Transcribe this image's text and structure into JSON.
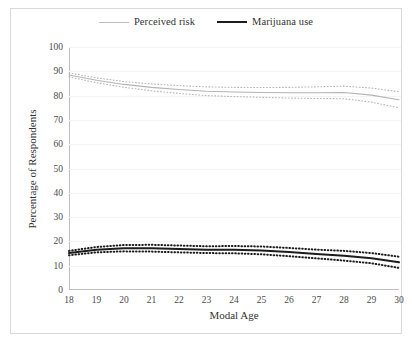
{
  "legend": {
    "items": [
      {
        "label": "Perceived risk",
        "color": "#bcbcbc",
        "style": "thin"
      },
      {
        "label": "Marijuana use",
        "color": "#1c1c1c",
        "style": "thick"
      }
    ]
  },
  "axes": {
    "xlabel": "Modal Age",
    "ylabel": "Percentage of Respondents",
    "yticks": [
      "100",
      "90",
      "80",
      "70",
      "60",
      "50",
      "40",
      "30",
      "20",
      "10",
      "0"
    ],
    "xticks": [
      "18",
      "19",
      "20",
      "21",
      "22",
      "23",
      "24",
      "25",
      "26",
      "27",
      "28",
      "29",
      "30"
    ]
  },
  "chart_data": {
    "type": "line",
    "title": "",
    "xlabel": "Modal Age",
    "ylabel": "Percentage of Respondents",
    "xlim": [
      18,
      30
    ],
    "ylim": [
      0,
      100
    ],
    "ytick_step": 10,
    "grid": false,
    "legend_position": "top-center",
    "x": [
      18,
      19,
      20,
      21,
      22,
      23,
      24,
      25,
      26,
      27,
      28,
      29,
      30
    ],
    "series": [
      {
        "name": "Perceived risk",
        "color": "#b4b4b4",
        "line": "solid",
        "values": [
          88.5,
          86.3,
          84.6,
          83.4,
          82.5,
          81.8,
          81.5,
          81.3,
          81.2,
          81.2,
          81.3,
          80.2,
          78.3
        ],
        "ci_upper": [
          89.3,
          87.3,
          85.8,
          84.8,
          84.1,
          83.6,
          83.4,
          83.3,
          83.4,
          83.6,
          83.9,
          83.1,
          81.6
        ],
        "ci_lower": [
          87.7,
          85.3,
          83.4,
          82.0,
          80.9,
          80.0,
          79.6,
          79.3,
          79.0,
          78.8,
          78.7,
          77.3,
          75.0
        ],
        "ci_style": "dotted"
      },
      {
        "name": "Marijuana use",
        "color": "#1c1c1c",
        "line": "solid",
        "values": [
          15.2,
          16.6,
          17.2,
          17.2,
          16.9,
          16.6,
          16.6,
          16.3,
          15.6,
          14.8,
          14.1,
          13.1,
          11.4
        ],
        "ci_upper": [
          16.1,
          17.7,
          18.5,
          18.6,
          18.3,
          18.0,
          18.1,
          17.9,
          17.3,
          16.6,
          16.1,
          15.2,
          13.7
        ],
        "ci_lower": [
          14.3,
          15.5,
          15.9,
          15.8,
          15.5,
          15.2,
          15.1,
          14.7,
          13.9,
          13.0,
          12.1,
          11.0,
          9.1
        ],
        "ci_style": "dotted"
      }
    ]
  }
}
